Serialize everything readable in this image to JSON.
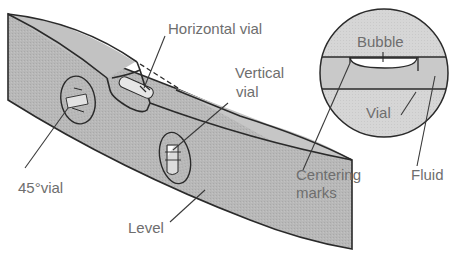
{
  "figure": {
    "colors": {
      "body_fill": "#b5b5b5",
      "body_top_fill": "#c4c4c4",
      "outline": "#2a2a2a",
      "label_text": "#6e6e6e",
      "vial_fill": "#d0d0d0",
      "bubble_fill": "#ffffff",
      "circle_fill": "#d8d8d8",
      "vial_band_fill": "#c6c6c6"
    }
  },
  "level_view": {
    "labels": {
      "horizontal_vial": "Horizontal vial",
      "vertical_vial_line1": "Vertical",
      "vertical_vial_line2": "vial",
      "vial_45": "45°vial",
      "level": "Level"
    }
  },
  "detail_view": {
    "labels": {
      "bubble": "Bubble",
      "vial": "Vial",
      "centering_line1": "Centering",
      "centering_line2": "marks",
      "fluid": "Fluid"
    }
  }
}
